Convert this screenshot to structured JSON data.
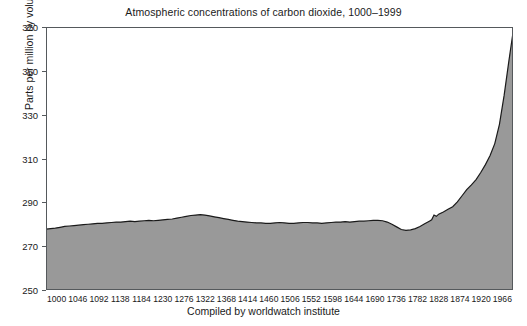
{
  "chart_data": {
    "type": "area",
    "title": "Atmospheric concentrations of carbon dioxide, 1000–1999",
    "xlabel": "Compiled by worldwatch institute",
    "ylabel": "Parts per million by volume",
    "ylim": [
      250,
      370
    ],
    "xlim": [
      1000,
      1999
    ],
    "grid": false,
    "legend": null,
    "y_ticks": [
      250,
      270,
      290,
      310,
      330,
      350,
      370
    ],
    "x_ticks": [
      1000,
      1046,
      1092,
      1138,
      1184,
      1230,
      1276,
      1322,
      1368,
      1414,
      1460,
      1506,
      1552,
      1598,
      1644,
      1690,
      1736,
      1782,
      1828,
      1874,
      1920,
      1966
    ],
    "series_name": "CO2 concentration",
    "fill_color": "#999999",
    "line_color": "#1a1a1a",
    "baseline": 250,
    "x": [
      1000,
      1010,
      1020,
      1030,
      1040,
      1050,
      1060,
      1070,
      1080,
      1090,
      1100,
      1110,
      1120,
      1130,
      1140,
      1150,
      1160,
      1170,
      1180,
      1190,
      1200,
      1210,
      1220,
      1230,
      1240,
      1250,
      1260,
      1270,
      1280,
      1290,
      1300,
      1310,
      1320,
      1330,
      1340,
      1350,
      1360,
      1370,
      1380,
      1390,
      1400,
      1410,
      1420,
      1430,
      1440,
      1450,
      1460,
      1470,
      1480,
      1490,
      1500,
      1510,
      1520,
      1530,
      1540,
      1550,
      1560,
      1570,
      1580,
      1590,
      1600,
      1610,
      1620,
      1630,
      1640,
      1650,
      1660,
      1670,
      1680,
      1690,
      1700,
      1710,
      1720,
      1730,
      1740,
      1750,
      1760,
      1770,
      1780,
      1790,
      1800,
      1810,
      1820,
      1825,
      1830,
      1835,
      1840,
      1850,
      1860,
      1870,
      1880,
      1890,
      1900,
      1910,
      1920,
      1930,
      1940,
      1950,
      1960,
      1970,
      1980,
      1990,
      1999
    ],
    "values": [
      277.8,
      278.0,
      278.2,
      278.6,
      279.0,
      279.2,
      279.4,
      279.6,
      279.8,
      280.0,
      280.2,
      280.4,
      280.4,
      280.6,
      280.8,
      281.0,
      281.0,
      281.2,
      281.4,
      281.2,
      281.4,
      281.6,
      281.8,
      281.6,
      281.8,
      282.0,
      282.2,
      282.4,
      282.8,
      283.2,
      283.6,
      284.0,
      284.2,
      284.4,
      284.2,
      283.8,
      283.4,
      283.0,
      282.6,
      282.2,
      281.8,
      281.4,
      281.2,
      281.0,
      280.8,
      280.6,
      280.6,
      280.4,
      280.4,
      280.6,
      280.8,
      280.6,
      280.4,
      280.4,
      280.6,
      280.8,
      280.8,
      280.6,
      280.6,
      280.4,
      280.6,
      280.8,
      281.0,
      281.0,
      281.2,
      281.0,
      281.2,
      281.4,
      281.4,
      281.6,
      281.8,
      281.8,
      281.6,
      281.0,
      280.0,
      278.8,
      277.6,
      277.2,
      277.4,
      278.0,
      279.0,
      280.2,
      281.4,
      282.0,
      284.2,
      283.6,
      284.6,
      285.6,
      286.8,
      288.0,
      290.2,
      293.0,
      295.8,
      298.0,
      300.4,
      303.6,
      307.2,
      311.4,
      316.8,
      325.6,
      338.8,
      354.2,
      367.4
    ]
  }
}
